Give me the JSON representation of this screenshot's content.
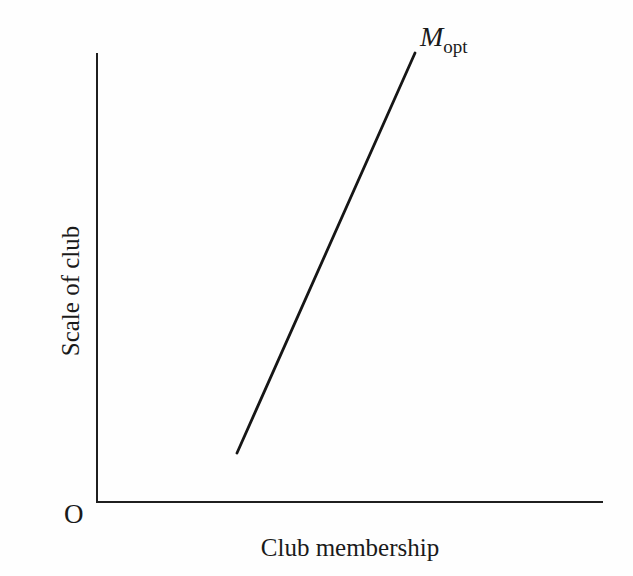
{
  "figure": {
    "background": "#fefefe",
    "ink_color": "#1a1a1a"
  },
  "chart_data": {
    "type": "line",
    "title": "",
    "xlabel": "Club membership",
    "ylabel": "Scale of club",
    "origin_label": "O",
    "grid": false,
    "tick_labels": "none",
    "legend": "none",
    "axis_ranges": {
      "x_frac": [
        0,
        1
      ],
      "y_frac": [
        0,
        1
      ],
      "note": "qualitative diagram; no numeric ticks or scale shown"
    },
    "series": [
      {
        "name": "M_opt",
        "label_base": "M",
        "label_subscript": "opt",
        "shape": "straight upward-sloping line",
        "x_frac": [
          0.28,
          0.63
        ],
        "y_frac": [
          0.11,
          1.0
        ],
        "description": "optimal club membership line rising steeply from lower-left to upper-right, labeled M_opt at its upper end"
      }
    ],
    "geometry_px": {
      "y_axis": {
        "x1": 97,
        "y1": 53,
        "x2": 97,
        "y2": 503
      },
      "x_axis": {
        "x1": 96,
        "y1": 502,
        "x2": 603,
        "y2": 502
      },
      "m_opt_line": {
        "x1": 237,
        "y1": 453,
        "x2": 415,
        "y2": 53
      }
    }
  }
}
